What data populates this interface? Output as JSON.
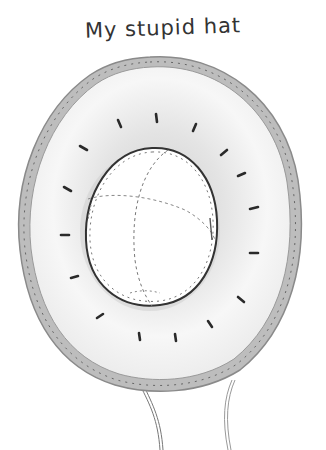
{
  "caption": "My stupid hat",
  "illustration": {
    "subject": "hat-top-view",
    "colors": {
      "ink": "#333333",
      "rim": "#9a9a9a",
      "shade": "#d8d8d8",
      "paper": "#ffffff"
    },
    "tick_count": 16,
    "strings": 2
  }
}
